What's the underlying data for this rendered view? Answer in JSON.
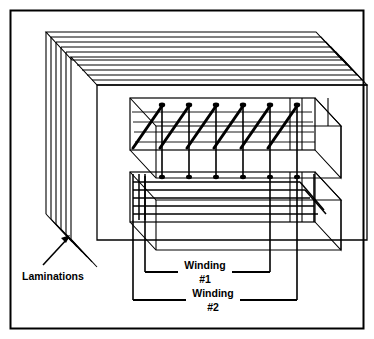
{
  "figure": {
    "kind": "technical-line-diagram",
    "background_color": "#ffffff",
    "ink_color": "#000000",
    "border": {
      "present": true,
      "color": "#000000",
      "thickness_px": 2
    }
  },
  "labels": {
    "laminations": "Laminations",
    "winding1_line1": "Winding",
    "winding1_line2": "#1",
    "winding2_line1": "Winding",
    "winding2_line2": "#2"
  },
  "annotations": {
    "laminations_leader": {
      "label": "Laminations",
      "arrow_head": "up-right",
      "points_to": "front-left lamination stack edge"
    },
    "winding1_bracket": {
      "label": "Winding #1",
      "style": "square-bracket-leader",
      "target": "upper coil"
    },
    "winding2_bracket": {
      "label": "Winding #2",
      "style": "square-bracket-leader",
      "target": "lower coil"
    }
  },
  "core": {
    "type": "E-I laminated iron core",
    "lamination_count": 5,
    "window_count": 2,
    "projection": "isometric / oblique"
  },
  "windings": [
    {
      "name": "Winding #1",
      "position": "upper window",
      "turns_visible": 6,
      "render": "thick diagonal wire strokes with rounded tops"
    },
    {
      "name": "Winding #2",
      "position": "lower window",
      "turns_visible": 6,
      "render": "horizontal wire lines receding into depth"
    }
  ]
}
